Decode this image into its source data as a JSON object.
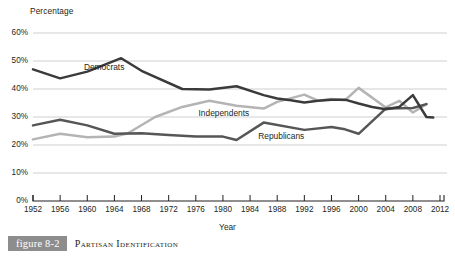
{
  "figure": {
    "tag": "figure 8-2",
    "caption": "Partisan Identification",
    "tag_bg": "#8d8d8d"
  },
  "chart_data": {
    "type": "line",
    "title": "Partisan Identification",
    "xlabel": "Year",
    "ylabel": "Percentage",
    "xlim": [
      1952,
      2012
    ],
    "ylim": [
      0,
      60
    ],
    "grid": true,
    "grid_axis": "y",
    "legend": "inline-labels",
    "ytick_labels": [
      "0%",
      "10%",
      "20%",
      "30%",
      "40%",
      "50%",
      "60%"
    ],
    "ytick_values": [
      0,
      10,
      20,
      30,
      40,
      50,
      60
    ],
    "xtick_labels": [
      "1952",
      "1956",
      "1960",
      "1964",
      "1968",
      "1972",
      "1976",
      "1980",
      "1984",
      "1988",
      "1992",
      "1996",
      "2000",
      "2004",
      "2008",
      "2012"
    ],
    "xtick_values": [
      1952,
      1956,
      1960,
      1964,
      1968,
      1972,
      1976,
      1980,
      1984,
      1988,
      1992,
      1996,
      2000,
      2004,
      2008,
      2012
    ],
    "series": [
      {
        "name": "Democrats",
        "color": "#3b3b3d",
        "label_x": 1959.5,
        "label_y": 47.8,
        "points": [
          [
            1952,
            47.0
          ],
          [
            1956,
            43.8
          ],
          [
            1960,
            46.2
          ],
          [
            1965,
            51.0
          ],
          [
            1968,
            46.5
          ],
          [
            1974,
            40.0
          ],
          [
            1978,
            39.8
          ],
          [
            1982,
            41.0
          ],
          [
            1986,
            37.8
          ],
          [
            1988,
            36.6
          ],
          [
            1990,
            36.0
          ],
          [
            1992,
            35.2
          ],
          [
            1994,
            35.8
          ],
          [
            1996,
            36.2
          ],
          [
            1998,
            36.2
          ],
          [
            2000,
            34.8
          ],
          [
            2002,
            33.6
          ],
          [
            2004,
            32.8
          ],
          [
            2006,
            33.6
          ],
          [
            2008,
            37.8
          ],
          [
            2010,
            30.0
          ],
          [
            2011,
            29.8
          ]
        ]
      },
      {
        "name": "Independents",
        "color": "#b4b4b4",
        "label_x": 1976.4,
        "label_y": 31.6,
        "points": [
          [
            1952,
            22.0
          ],
          [
            1956,
            24.0
          ],
          [
            1960,
            22.8
          ],
          [
            1964,
            23.0
          ],
          [
            1966,
            24.2
          ],
          [
            1970,
            30.0
          ],
          [
            1974,
            33.6
          ],
          [
            1978,
            35.8
          ],
          [
            1982,
            34.0
          ],
          [
            1986,
            33.0
          ],
          [
            1988,
            35.4
          ],
          [
            1992,
            38.0
          ],
          [
            1994,
            35.8
          ],
          [
            1996,
            36.4
          ],
          [
            1998,
            36.0
          ],
          [
            2000,
            40.4
          ],
          [
            2004,
            33.4
          ],
          [
            2006,
            35.8
          ],
          [
            2008,
            31.6
          ],
          [
            2010,
            34.6
          ]
        ]
      },
      {
        "name": "Republicans",
        "color": "#565659",
        "label_x": 1985.2,
        "label_y": 23.2,
        "points": [
          [
            1952,
            27.0
          ],
          [
            1956,
            29.0
          ],
          [
            1960,
            27.0
          ],
          [
            1964,
            24.0
          ],
          [
            1968,
            24.2
          ],
          [
            1972,
            23.6
          ],
          [
            1976,
            23.0
          ],
          [
            1980,
            23.0
          ],
          [
            1982,
            21.8
          ],
          [
            1986,
            28.0
          ],
          [
            1992,
            25.4
          ],
          [
            1996,
            26.4
          ],
          [
            1998,
            25.6
          ],
          [
            2000,
            24.0
          ],
          [
            2004,
            33.0
          ],
          [
            2008,
            33.2
          ],
          [
            2010,
            34.6
          ]
        ]
      }
    ],
    "annotations": [
      {
        "text": "Percentage",
        "role": "y-axis-title"
      },
      {
        "text": "Year",
        "role": "x-axis-title"
      }
    ]
  }
}
